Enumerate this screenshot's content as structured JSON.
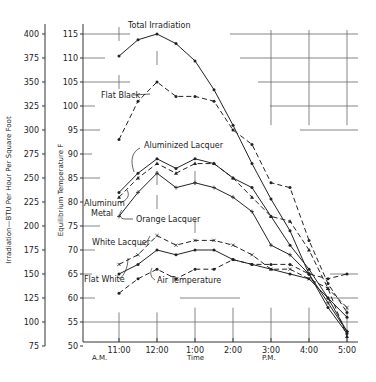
{
  "chart_data": {
    "type": "line",
    "title": "",
    "xlabel": "Time",
    "ylabel_left": "Irradiation—BTU Per Hour Per Square Foot",
    "ylabel_right": "Equilibrium Temperature F",
    "x_ticks": [
      "11:00",
      "12:00",
      "1:00",
      "2:00",
      "3:00",
      "4:00",
      "5:00"
    ],
    "x_sublabels": {
      "am": "A.M.",
      "pm": "P.M."
    },
    "y_left_ticks": [
      75,
      100,
      125,
      150,
      175,
      200,
      225,
      250,
      275,
      300,
      325,
      350,
      375,
      400
    ],
    "y_right_ticks": [
      50,
      55,
      60,
      65,
      70,
      75,
      80,
      85,
      90,
      95,
      100,
      105,
      110,
      115
    ],
    "ylim_left": [
      75,
      400
    ],
    "ylim_right": [
      50,
      115
    ],
    "x": [
      11.0,
      11.5,
      12.0,
      12.5,
      13.0,
      13.5,
      14.0,
      14.5,
      15.0,
      15.5,
      16.0,
      16.5,
      17.0
    ],
    "series": [
      {
        "name": "Total Irradiation",
        "axis": "left",
        "style": "solid-dot",
        "x": [
          11.0,
          11.5,
          12.0,
          12.5,
          13.0,
          13.5,
          14.0,
          14.5,
          15.0,
          15.5,
          16.0,
          16.5,
          17.0
        ],
        "values": [
          377,
          394,
          400,
          390,
          372,
          342,
          305,
          265,
          228,
          195,
          150,
          115,
          88
        ]
      },
      {
        "name": "Flat Black",
        "axis": "right",
        "style": "dashed-dot",
        "x": [
          11.0,
          11.5,
          12.0,
          12.5,
          13.0,
          13.5,
          14.0,
          14.5,
          15.0,
          15.5,
          16.0,
          16.5,
          17.0
        ],
        "values": [
          93,
          101,
          105,
          102,
          102,
          101,
          95,
          92,
          84,
          83,
          72,
          63,
          57
        ]
      },
      {
        "name": "Aluminized Lacquer",
        "axis": "right",
        "style": "solid-dot",
        "x": [
          11.0,
          11.5,
          12.0,
          12.5,
          13.0,
          13.5,
          14.0,
          14.5,
          15.0,
          15.5,
          16.0,
          16.5,
          17.0
        ],
        "values": [
          82,
          86,
          89,
          87,
          89,
          88,
          85,
          83,
          77,
          71,
          66,
          60,
          53
        ]
      },
      {
        "name": "Aluminum Metal",
        "axis": "right",
        "style": "dashed-triangle",
        "x": [
          11.0,
          11.5,
          12.0,
          12.5,
          13.0,
          13.5,
          14.0,
          14.5,
          15.0,
          15.5,
          16.0,
          16.5,
          17.0
        ],
        "values": [
          81,
          85,
          88,
          86,
          88,
          88,
          85,
          81,
          77,
          76,
          70,
          62,
          52
        ]
      },
      {
        "name": "Orange Lacquer",
        "axis": "right",
        "style": "solid-plus",
        "x": [
          11.0,
          11.5,
          12.0,
          12.5,
          13.0,
          13.5,
          14.0,
          14.5,
          15.0,
          15.5,
          16.0,
          16.5,
          17.0
        ],
        "values": [
          77,
          82,
          86,
          83,
          84,
          83,
          81,
          78,
          71,
          69,
          65,
          59,
          53
        ]
      },
      {
        "name": "White Lacquer",
        "axis": "right",
        "style": "dashed-x",
        "x": [
          11.0,
          11.5,
          12.0,
          12.5,
          13.0,
          13.5,
          14.0,
          14.5,
          15.0,
          15.5,
          16.0,
          16.5,
          17.0
        ],
        "values": [
          67,
          69,
          73,
          71,
          72,
          72,
          71,
          69,
          66,
          66,
          64,
          62,
          58
        ]
      },
      {
        "name": "Flat White",
        "axis": "right",
        "style": "solid-dot",
        "x": [
          11.0,
          11.5,
          12.0,
          12.5,
          13.0,
          13.5,
          14.0,
          14.5,
          15.0,
          15.5,
          16.0,
          16.5,
          17.0
        ],
        "values": [
          65,
          67,
          70,
          69,
          70,
          70,
          68,
          67,
          66,
          65,
          64,
          60,
          56
        ]
      },
      {
        "name": "Air Temperature",
        "axis": "right",
        "style": "dashed-dot",
        "x": [
          11.0,
          11.5,
          12.0,
          12.5,
          13.0,
          13.5,
          14.0,
          14.5,
          15.0,
          15.5,
          16.0,
          16.5,
          17.0
        ],
        "values": [
          61,
          64,
          66,
          64,
          66,
          66,
          68,
          67,
          67,
          67,
          65,
          64,
          65
        ]
      }
    ],
    "annotations": [
      "Total Irradiation",
      "Flat Black",
      "Aluminized Lacquer",
      "Aluminum Metal",
      "Orange Lacquer",
      "White Lacquer",
      "Flat White",
      "Air Temperature"
    ],
    "grid": "partial crosshairs",
    "legend": "inline labels"
  },
  "labels": {
    "total_irradiation": "Total Irradiation",
    "flat_black": "Flat Black",
    "aluminized_lacquer": "Aluminized Lacquer",
    "aluminum": "Aluminum",
    "metal": "Metal",
    "orange_lacquer": "Orange Lacquer",
    "white_lacquer": "White Lacquer",
    "flat_white": "Flat White",
    "air_temperature": "Air Temperature"
  }
}
